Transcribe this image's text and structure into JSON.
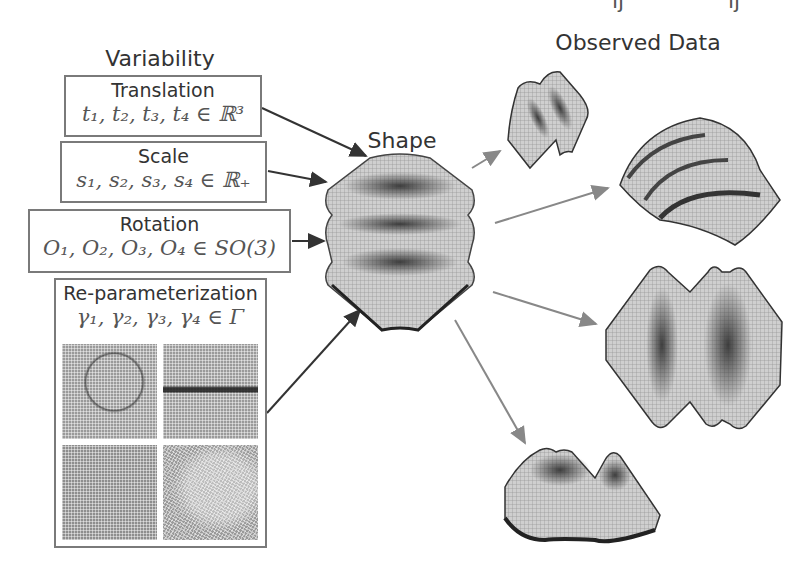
{
  "top_fragments": [
    "ıʃ",
    "ıʃ"
  ],
  "left": {
    "heading": "Variability",
    "boxes": [
      {
        "label": "Translation",
        "math": "t₁, t₂, t₃, t₄ ∈ ℝ³"
      },
      {
        "label": "Scale",
        "math": "s₁, s₂, s₃, s₄ ∈ ℝ₊"
      },
      {
        "label": "Rotation",
        "math": "O₁, O₂, O₃, O₄ ∈ SO(3)"
      },
      {
        "label": "Re-parameterization",
        "math": "γ₁, γ₂, γ₃, γ₄ ∈ Γ"
      }
    ],
    "reparam_tiles": [
      "mesh-warp-1",
      "mesh-warp-2",
      "mesh-warp-3",
      "mesh-warp-4"
    ]
  },
  "center": {
    "heading": "Shape"
  },
  "right": {
    "heading": "Observed Data",
    "observations": [
      "observed-shape-1",
      "observed-shape-2",
      "observed-shape-3",
      "observed-shape-4"
    ]
  },
  "colors": {
    "box_border": "#7a7a7a",
    "input_arrow": "#333333",
    "output_arrow": "#888888",
    "text": "#333333"
  }
}
